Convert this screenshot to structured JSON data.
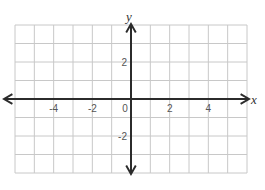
{
  "chart_data": {
    "type": "coordinate-grid",
    "title": "",
    "xlabel": "x",
    "ylabel": "y",
    "xlim": [
      -6,
      6
    ],
    "ylim": [
      -4,
      4
    ],
    "grid": true,
    "x_ticks": [
      {
        "value": -4,
        "label": "-4"
      },
      {
        "value": -2,
        "label": "-2"
      },
      {
        "value": 0,
        "label": "0"
      },
      {
        "value": 2,
        "label": "2"
      },
      {
        "value": 4,
        "label": "4"
      }
    ],
    "y_ticks": [
      {
        "value": 2,
        "label": "2"
      },
      {
        "value": -2,
        "label": "-2"
      }
    ],
    "series": []
  },
  "colors": {
    "grid": "#c8c8c8",
    "axis": "#2b2b2b",
    "text": "#555555"
  }
}
